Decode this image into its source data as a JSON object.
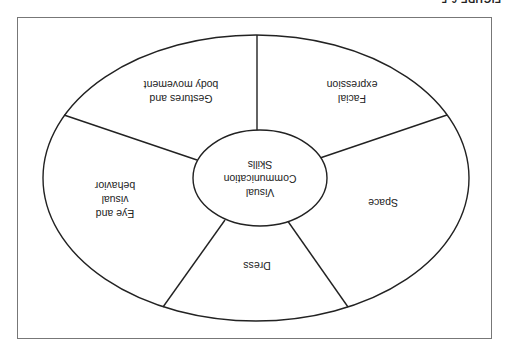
{
  "figure": {
    "label": "FIGURE 6-5",
    "orientation": "rotated 180 degrees"
  },
  "diagram": {
    "center": {
      "lines": [
        "Visual",
        "Communication",
        "Skills"
      ]
    },
    "segments": [
      {
        "id": "gestures",
        "lines": [
          "Gestures and",
          "body movement"
        ]
      },
      {
        "id": "facial",
        "lines": [
          "Facial",
          "expression"
        ]
      },
      {
        "id": "space",
        "lines": [
          "Space"
        ]
      },
      {
        "id": "dress",
        "lines": [
          "Dress"
        ]
      },
      {
        "id": "eye",
        "lines": [
          "Eye and",
          "visual",
          "behavior"
        ]
      }
    ]
  }
}
